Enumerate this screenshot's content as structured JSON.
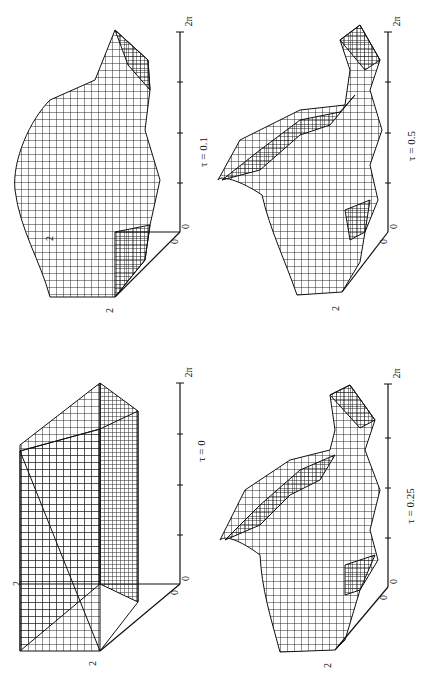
{
  "figure": {
    "orientation": "rotated-90-ccw",
    "panels": [
      {
        "id": "top-left",
        "tau_label": "τ = 0.1",
        "x_tick_start": "0",
        "x_tick_end": "2π",
        "depth_tick": "0",
        "depth_label": "2",
        "z_label": "2"
      },
      {
        "id": "bottom-left",
        "tau_label": "τ = 0",
        "x_tick_start": "0",
        "x_tick_end": "2π",
        "depth_tick": "0",
        "depth_label": "2",
        "z_label": "2"
      },
      {
        "id": "top-right",
        "tau_label": "τ = 0.5",
        "x_tick_start": "0",
        "x_tick_end": "2π",
        "depth_tick": "0",
        "depth_label": "2"
      },
      {
        "id": "bottom-right",
        "tau_label": "τ = 0.25",
        "x_tick_start": "0",
        "x_tick_end": "2π",
        "depth_tick": "0",
        "depth_label": "2"
      }
    ]
  },
  "colors": {
    "ink": "#111111",
    "background": "#ffffff"
  }
}
